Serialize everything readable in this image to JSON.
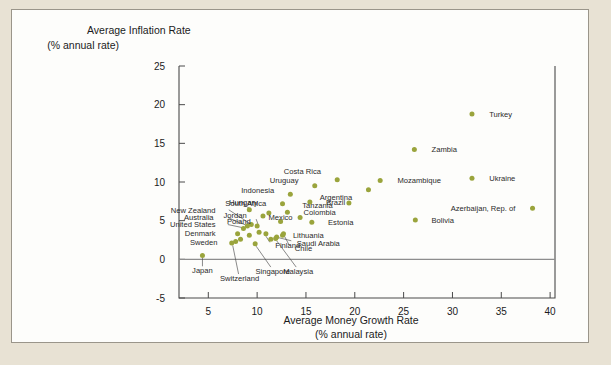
{
  "chart_data": {
    "type": "scatter",
    "title": "",
    "ylabel": "Average Inflation Rate",
    "ylabel_sub": "(% annual rate)",
    "xlabel": "Average Money Growth Rate",
    "xlabel_sub": "(% annual rate)",
    "xlim": [
      2,
      40.5
    ],
    "ylim": [
      -5,
      25
    ],
    "xticks": [
      5,
      10,
      15,
      20,
      25,
      30,
      35,
      40
    ],
    "yticks": [
      -5,
      0,
      5,
      10,
      15,
      20,
      25
    ],
    "grid": false,
    "legend": "none",
    "zero_line": true,
    "marker_color": "#9aa43c",
    "points": [
      {
        "name": "Turkey",
        "x": 32.0,
        "y": 18.8,
        "lx": 33.3,
        "ly": 18.8,
        "anchor": "start"
      },
      {
        "name": "Zambia",
        "x": 26.1,
        "y": 14.2,
        "lx": 27.4,
        "ly": 14.2,
        "anchor": "start"
      },
      {
        "name": "Ukraine",
        "x": 32.0,
        "y": 10.5,
        "lx": 33.3,
        "ly": 10.5,
        "anchor": "start"
      },
      {
        "name": "Mozambique",
        "x": 22.6,
        "y": 10.2,
        "lx": 23.9,
        "ly": 10.2,
        "anchor": "start"
      },
      {
        "name": "Azerbaijan, Rep. of",
        "x": 38.2,
        "y": 6.6,
        "lx": 36.9,
        "ly": 6.6,
        "anchor": "end"
      },
      {
        "name": "Bolivia",
        "x": 26.2,
        "y": 5.1,
        "lx": 27.4,
        "ly": 5.1,
        "anchor": "start"
      },
      {
        "name": "Costa Rica",
        "x": 18.2,
        "y": 10.3,
        "lx": 17.0,
        "ly": 11.4,
        "anchor": "end"
      },
      {
        "name": "Argentina",
        "x": 21.4,
        "y": 9.0,
        "lx": 20.2,
        "ly": 8.1,
        "anchor": "end"
      },
      {
        "name": "Uruguay",
        "x": 15.9,
        "y": 9.5,
        "lx": 14.7,
        "ly": 10.2,
        "anchor": "end"
      },
      {
        "name": "Tanzania",
        "x": 19.4,
        "y": 7.3,
        "lx": 18.2,
        "ly": 7.0,
        "anchor": "end"
      },
      {
        "name": "Indonesia",
        "x": 13.4,
        "y": 8.4,
        "lx": 12.2,
        "ly": 9.0,
        "anchor": "end"
      },
      {
        "name": "Brazil",
        "x": 15.4,
        "y": 7.4,
        "lx": 16.6,
        "ly": 7.4,
        "anchor": "start"
      },
      {
        "name": "South Africa",
        "x": 12.6,
        "y": 7.2,
        "lx": 11.4,
        "ly": 7.3,
        "anchor": "end"
      },
      {
        "name": "Colombia",
        "x": 13.1,
        "y": 6.1,
        "lx": 14.3,
        "ly": 6.1,
        "anchor": "start"
      },
      {
        "name": "Mexico",
        "x": 12.4,
        "y": 4.9,
        "lx": 12.4,
        "ly": 5.4,
        "anchor": "middle"
      },
      {
        "name": "Estonia",
        "x": 15.6,
        "y": 4.8,
        "lx": 16.8,
        "ly": 4.8,
        "anchor": "start"
      },
      {
        "name": "Jordan",
        "x": 10.6,
        "y": 5.6,
        "lx": 9.4,
        "ly": 5.7,
        "anchor": "end"
      },
      {
        "name": "Hungary",
        "x": 9.2,
        "y": 6.4,
        "lx": 8.6,
        "ly": 7.4,
        "anchor": "middle"
      },
      {
        "name": "Poland",
        "x": 10.0,
        "y": 4.3,
        "lx": 9.8,
        "ly": 5.0,
        "anchor": "end"
      },
      {
        "name": "Lithuania",
        "x": 12.6,
        "y": 3.1,
        "lx": 13.2,
        "ly": 3.1,
        "anchor": "start"
      },
      {
        "name": "Saudi Arabia",
        "x": 12.0,
        "y": 2.9,
        "lx": 13.6,
        "ly": 2.1,
        "anchor": "start"
      },
      {
        "name": "Chile",
        "x": 12.7,
        "y": 3.3,
        "lx": 13.4,
        "ly": 1.5,
        "anchor": "start"
      },
      {
        "name": "Finland",
        "x": 10.9,
        "y": 3.3,
        "lx": 11.4,
        "ly": 1.9,
        "anchor": "start"
      },
      {
        "name": "New Zealand",
        "x": 9.4,
        "y": 4.5,
        "lx": 6.2,
        "ly": 6.4,
        "anchor": "end"
      },
      {
        "name": "Australia",
        "x": 9.0,
        "y": 4.3,
        "lx": 6.0,
        "ly": 5.4,
        "anchor": "end"
      },
      {
        "name": "United States",
        "x": 8.6,
        "y": 4.0,
        "lx": 6.2,
        "ly": 4.5,
        "anchor": "end"
      },
      {
        "name": "Denmark",
        "x": 8.0,
        "y": 3.3,
        "lx": 6.2,
        "ly": 3.4,
        "anchor": "end"
      },
      {
        "name": "Sweden",
        "x": 7.8,
        "y": 2.3,
        "lx": 6.4,
        "ly": 2.2,
        "anchor": "end"
      },
      {
        "name": "Japan",
        "x": 4.4,
        "y": 0.5,
        "lx": 4.4,
        "ly": -1.4,
        "anchor": "middle"
      },
      {
        "name": "Switzerland",
        "x": 7.4,
        "y": 2.1,
        "lx": 8.2,
        "ly": -2.4,
        "anchor": "middle"
      },
      {
        "name": "Singapore",
        "x": 9.8,
        "y": 2.0,
        "lx": 11.6,
        "ly": -1.5,
        "anchor": "middle"
      },
      {
        "name": "Malaysia",
        "x": 11.9,
        "y": 2.7,
        "lx": 14.2,
        "ly": -1.5,
        "anchor": "middle"
      }
    ],
    "extra_points": [
      {
        "x": 11.2,
        "y": 6.0
      },
      {
        "x": 14.4,
        "y": 5.4
      },
      {
        "x": 10.2,
        "y": 3.5
      },
      {
        "x": 11.4,
        "y": 2.6
      },
      {
        "x": 9.2,
        "y": 3.1
      },
      {
        "x": 8.3,
        "y": 2.6
      }
    ],
    "leader_lines": [
      {
        "x1": 7.1,
        "y1": 6.4,
        "x2": 9.3,
        "y2": 4.6
      },
      {
        "x1": 7.0,
        "y1": 5.4,
        "x2": 8.9,
        "y2": 4.4
      },
      {
        "x1": 7.0,
        "y1": 4.5,
        "x2": 8.5,
        "y2": 4.1
      },
      {
        "x1": 4.4,
        "y1": -0.9,
        "x2": 4.4,
        "y2": 0.2
      },
      {
        "x1": 8.1,
        "y1": -1.9,
        "x2": 7.5,
        "y2": 1.8
      },
      {
        "x1": 11.4,
        "y1": -1.0,
        "x2": 9.9,
        "y2": 1.7
      },
      {
        "x1": 14.0,
        "y1": -1.0,
        "x2": 12.0,
        "y2": 2.4
      },
      {
        "x1": 11.3,
        "y1": 2.2,
        "x2": 10.9,
        "y2": 3.0
      },
      {
        "x1": 13.3,
        "y1": 1.8,
        "x2": 12.8,
        "y2": 3.0
      },
      {
        "x1": 13.5,
        "y1": 2.4,
        "x2": 12.2,
        "y2": 2.8
      },
      {
        "x1": 9.9,
        "y1": 5.2,
        "x2": 10.1,
        "y2": 4.5
      },
      {
        "x1": 8.6,
        "y1": 7.1,
        "x2": 9.2,
        "y2": 6.6
      }
    ]
  }
}
